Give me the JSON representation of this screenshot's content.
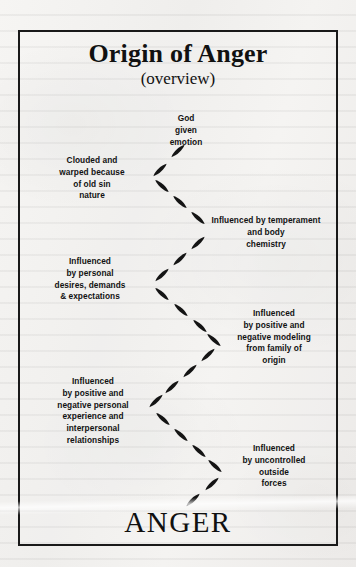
{
  "page": {
    "background_color": "#f2f1ef",
    "border_color": "#191919",
    "text_color": "#121212"
  },
  "title": {
    "main": "Origin of Anger",
    "sub": "(overview)"
  },
  "outcome": {
    "label": "ANGER"
  },
  "nodes": [
    {
      "id": "god-given-emotion",
      "side": "right",
      "lines": [
        "God",
        "given",
        "emotion"
      ]
    },
    {
      "id": "clouded-warped-old-sin-nature",
      "side": "left",
      "lines": [
        "Clouded and",
        "warped because",
        "of old sin",
        "nature"
      ]
    },
    {
      "id": "temperament-body-chemistry",
      "side": "right",
      "lines": [
        "Influenced by temperament",
        "and body",
        "chemistry"
      ]
    },
    {
      "id": "personal-desires-demands-expectations",
      "side": "left",
      "lines": [
        "Influenced",
        "by personal",
        "desires, demands",
        "& expectations"
      ]
    },
    {
      "id": "family-of-origin-modeling",
      "side": "right",
      "lines": [
        "Influenced",
        "by positive and",
        "negative modeling",
        "from family of",
        "origin"
      ]
    },
    {
      "id": "personal-experience-relationships",
      "side": "left",
      "lines": [
        "Influenced",
        "by positive and",
        "negative personal",
        "experience and",
        "interpersonal",
        "relationships"
      ]
    },
    {
      "id": "uncontrolled-outside-forces",
      "side": "right",
      "lines": [
        "Influenced",
        "by uncontrolled",
        "outside",
        "forces"
      ]
    }
  ],
  "flow": {
    "style": "zigzag-dashed-arrow",
    "vertices": [
      {
        "x": 184,
        "y": 146
      },
      {
        "x": 152,
        "y": 176
      },
      {
        "x": 208,
        "y": 228
      },
      {
        "x": 152,
        "y": 283
      },
      {
        "x": 216,
        "y": 340
      },
      {
        "x": 152,
        "y": 404
      },
      {
        "x": 222,
        "y": 472
      },
      {
        "x": 186,
        "y": 506
      }
    ]
  }
}
